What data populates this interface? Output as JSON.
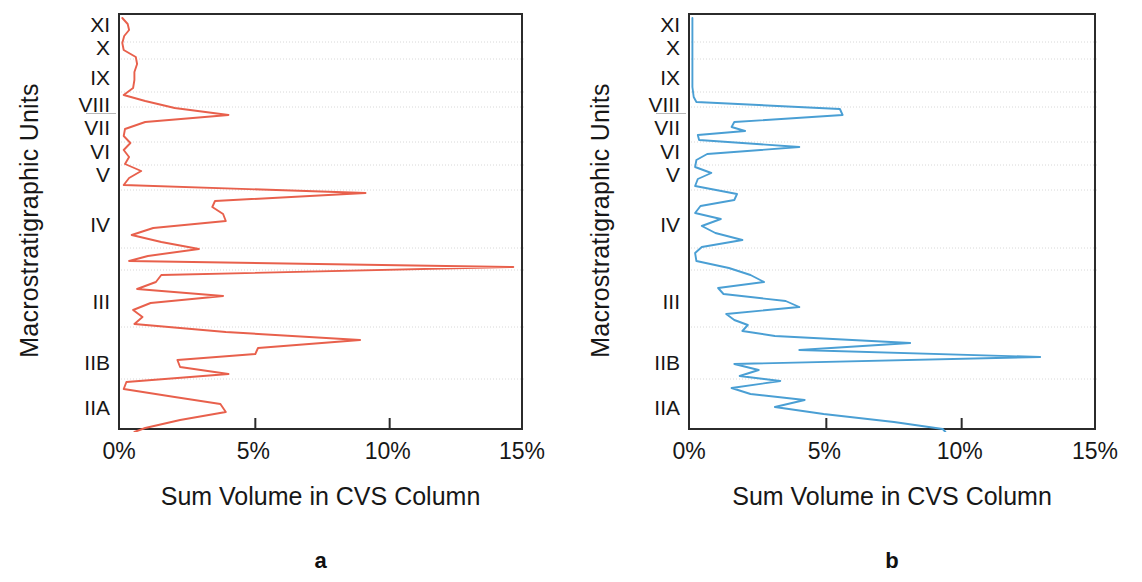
{
  "figure": {
    "panels": [
      {
        "letter": "a",
        "y_axis_title": "Macrostratigraphic Units",
        "x_axis_title": "Sum Volume in CVS Column",
        "series_color": "#e8604c"
      },
      {
        "letter": "b",
        "y_axis_title": "Macrostratigraphic Units",
        "x_axis_title": "Sum Volume in CVS Column",
        "series_color": "#4a9fd4"
      }
    ]
  },
  "chart_data": [
    {
      "type": "line",
      "title": "a",
      "xlabel": "Sum Volume in CVS Column",
      "ylabel": "Macrostratigraphic Units",
      "orientation": "horizontal",
      "xlim": [
        0,
        15
      ],
      "xticks": [
        0,
        5,
        10,
        15
      ],
      "xtick_labels": [
        "0%",
        "5%",
        "10%",
        "15%"
      ],
      "ytick_labels": [
        "XI",
        "X",
        "IX",
        "VIII",
        "VII",
        "VI",
        "V",
        "IV",
        "III",
        "IIB",
        "IIA"
      ],
      "ytick_positions": [
        25,
        48,
        78,
        105,
        128,
        152,
        175,
        225,
        302,
        363,
        408
      ],
      "grid": true,
      "legend": "none",
      "series": [
        {
          "name": "Sum Volume",
          "color": "#e8604c",
          "points": [
            {
              "y": 16,
              "v": 0.05
            },
            {
              "y": 22,
              "v": 0.25
            },
            {
              "y": 28,
              "v": 0.3
            },
            {
              "y": 34,
              "v": 0.12
            },
            {
              "y": 41,
              "v": 0.05
            },
            {
              "y": 48,
              "v": 0.1
            },
            {
              "y": 55,
              "v": 0.55
            },
            {
              "y": 62,
              "v": 0.6
            },
            {
              "y": 70,
              "v": 0.5
            },
            {
              "y": 78,
              "v": 0.5
            },
            {
              "y": 86,
              "v": 0.45
            },
            {
              "y": 93,
              "v": 0.1
            },
            {
              "y": 99,
              "v": 0.9
            },
            {
              "y": 106,
              "v": 2.0
            },
            {
              "y": 113,
              "v": 4.0
            },
            {
              "y": 120,
              "v": 0.9
            },
            {
              "y": 127,
              "v": 0.15
            },
            {
              "y": 134,
              "v": 0.1
            },
            {
              "y": 141,
              "v": 0.35
            },
            {
              "y": 148,
              "v": 0.1
            },
            {
              "y": 155,
              "v": 0.3
            },
            {
              "y": 162,
              "v": 0.15
            },
            {
              "y": 169,
              "v": 0.75
            },
            {
              "y": 176,
              "v": 0.3
            },
            {
              "y": 183,
              "v": 0.1
            },
            {
              "y": 191,
              "v": 9.1
            },
            {
              "y": 199,
              "v": 3.5
            },
            {
              "y": 205,
              "v": 3.4
            },
            {
              "y": 212,
              "v": 3.8
            },
            {
              "y": 219,
              "v": 3.9
            },
            {
              "y": 226,
              "v": 1.2
            },
            {
              "y": 233,
              "v": 0.4
            },
            {
              "y": 240,
              "v": 1.5
            },
            {
              "y": 247,
              "v": 2.9
            },
            {
              "y": 254,
              "v": 1.0
            },
            {
              "y": 259,
              "v": 0.3
            },
            {
              "y": 265,
              "v": 14.6
            },
            {
              "y": 273,
              "v": 1.5
            },
            {
              "y": 280,
              "v": 1.3
            },
            {
              "y": 287,
              "v": 0.6
            },
            {
              "y": 294,
              "v": 3.8
            },
            {
              "y": 301,
              "v": 1.1
            },
            {
              "y": 308,
              "v": 0.45
            },
            {
              "y": 315,
              "v": 0.8
            },
            {
              "y": 322,
              "v": 0.5
            },
            {
              "y": 330,
              "v": 3.9
            },
            {
              "y": 338,
              "v": 8.9
            },
            {
              "y": 346,
              "v": 5.1
            },
            {
              "y": 352,
              "v": 5.0
            },
            {
              "y": 358,
              "v": 2.1
            },
            {
              "y": 365,
              "v": 2.2
            },
            {
              "y": 372,
              "v": 4.0
            },
            {
              "y": 380,
              "v": 0.2
            },
            {
              "y": 387,
              "v": 0.1
            },
            {
              "y": 395,
              "v": 2.0
            },
            {
              "y": 402,
              "v": 3.7
            },
            {
              "y": 410,
              "v": 3.9
            },
            {
              "y": 418,
              "v": 2.2
            },
            {
              "y": 426,
              "v": 0.9
            },
            {
              "y": 430,
              "v": 0.5
            }
          ]
        }
      ]
    },
    {
      "type": "line",
      "title": "b",
      "xlabel": "Sum Volume in CVS Column",
      "ylabel": "Macrostratigraphic Units",
      "orientation": "horizontal",
      "xlim": [
        0,
        15
      ],
      "xticks": [
        0,
        5,
        10,
        15
      ],
      "xtick_labels": [
        "0%",
        "5%",
        "10%",
        "15%"
      ],
      "ytick_labels": [
        "XI",
        "X",
        "IX",
        "VIII",
        "VII",
        "VI",
        "V",
        "IV",
        "III",
        "IIB",
        "IIA"
      ],
      "ytick_positions": [
        25,
        48,
        78,
        105,
        128,
        152,
        175,
        225,
        302,
        363,
        408
      ],
      "grid": true,
      "legend": "none",
      "series": [
        {
          "name": "Sum Volume",
          "color": "#4a9fd4",
          "points": [
            {
              "y": 16,
              "v": 0.05
            },
            {
              "y": 30,
              "v": 0.05
            },
            {
              "y": 50,
              "v": 0.05
            },
            {
              "y": 70,
              "v": 0.05
            },
            {
              "y": 85,
              "v": 0.05
            },
            {
              "y": 95,
              "v": 0.1
            },
            {
              "y": 100,
              "v": 0.2
            },
            {
              "y": 107,
              "v": 5.5
            },
            {
              "y": 113,
              "v": 5.6
            },
            {
              "y": 120,
              "v": 1.6
            },
            {
              "y": 125,
              "v": 1.5
            },
            {
              "y": 129,
              "v": 2.0
            },
            {
              "y": 133,
              "v": 0.25
            },
            {
              "y": 138,
              "v": 0.3
            },
            {
              "y": 145,
              "v": 4.0
            },
            {
              "y": 152,
              "v": 0.6
            },
            {
              "y": 158,
              "v": 0.2
            },
            {
              "y": 165,
              "v": 0.15
            },
            {
              "y": 171,
              "v": 0.75
            },
            {
              "y": 177,
              "v": 0.25
            },
            {
              "y": 184,
              "v": 0.15
            },
            {
              "y": 192,
              "v": 1.7
            },
            {
              "y": 198,
              "v": 1.6
            },
            {
              "y": 204,
              "v": 0.35
            },
            {
              "y": 211,
              "v": 0.15
            },
            {
              "y": 217,
              "v": 1.1
            },
            {
              "y": 224,
              "v": 0.4
            },
            {
              "y": 231,
              "v": 0.9
            },
            {
              "y": 238,
              "v": 1.9
            },
            {
              "y": 245,
              "v": 0.4
            },
            {
              "y": 251,
              "v": 0.15
            },
            {
              "y": 259,
              "v": 0.2
            },
            {
              "y": 266,
              "v": 1.4
            },
            {
              "y": 273,
              "v": 2.2
            },
            {
              "y": 280,
              "v": 2.7
            },
            {
              "y": 286,
              "v": 1.0
            },
            {
              "y": 292,
              "v": 1.2
            },
            {
              "y": 299,
              "v": 3.5
            },
            {
              "y": 305,
              "v": 4.0
            },
            {
              "y": 312,
              "v": 1.3
            },
            {
              "y": 318,
              "v": 1.6
            },
            {
              "y": 323,
              "v": 2.1
            },
            {
              "y": 329,
              "v": 1.9
            },
            {
              "y": 334,
              "v": 3.1
            },
            {
              "y": 341,
              "v": 8.1
            },
            {
              "y": 348,
              "v": 4.0
            },
            {
              "y": 355,
              "v": 12.9
            },
            {
              "y": 362,
              "v": 1.6
            },
            {
              "y": 368,
              "v": 2.5
            },
            {
              "y": 374,
              "v": 1.8
            },
            {
              "y": 379,
              "v": 3.3
            },
            {
              "y": 386,
              "v": 1.5
            },
            {
              "y": 392,
              "v": 2.2
            },
            {
              "y": 398,
              "v": 4.2
            },
            {
              "y": 405,
              "v": 3.1
            },
            {
              "y": 412,
              "v": 4.9
            },
            {
              "y": 420,
              "v": 7.5
            },
            {
              "y": 427,
              "v": 9.3
            },
            {
              "y": 430,
              "v": 9.4
            }
          ]
        }
      ]
    }
  ]
}
